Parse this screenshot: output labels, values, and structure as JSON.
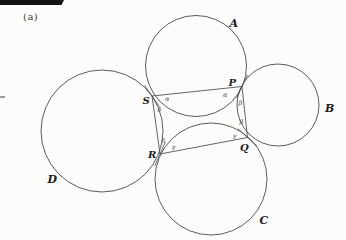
{
  "page": {
    "label_a": "(a)"
  },
  "figure": {
    "circles": [
      {
        "id": "A",
        "label": "A",
        "cx": 196,
        "cy": 66,
        "r": 50.5,
        "lx": 229.5,
        "ly": 27
      },
      {
        "id": "B",
        "label": "B",
        "cx": 278,
        "cy": 105,
        "r": 41,
        "lx": 325,
        "ly": 112
      },
      {
        "id": "C",
        "label": "C",
        "cx": 211,
        "cy": 179,
        "r": 56,
        "lx": 259.5,
        "ly": 223.5
      },
      {
        "id": "D",
        "label": "D",
        "cx": 102,
        "cy": 131,
        "r": 61,
        "lx": 47.5,
        "ly": 183
      }
    ],
    "points": [
      {
        "id": "S",
        "label": "S",
        "x": 152,
        "y": 96,
        "lx": 142.5,
        "ly": 103.5,
        "between": [
          "A",
          "D"
        ]
      },
      {
        "id": "P",
        "label": "P",
        "x": 242,
        "y": 86.5,
        "lx": 228.5,
        "ly": 86,
        "between": [
          "A",
          "B"
        ]
      },
      {
        "id": "Q",
        "label": "Q",
        "x": 247.5,
        "y": 137.5,
        "lx": 240,
        "ly": 151,
        "between": [
          "B",
          "C"
        ]
      },
      {
        "id": "R",
        "label": "R",
        "x": 160,
        "y": 154,
        "lx": 148,
        "ly": 157.5,
        "between": [
          "C",
          "D"
        ]
      }
    ],
    "quad": [
      "S",
      "P",
      "Q",
      "R"
    ],
    "tangent_half_length": 13,
    "angle_labels": [
      {
        "text": "α",
        "x": 165,
        "y": 101
      },
      {
        "text": "α",
        "x": 223,
        "y": 97
      },
      {
        "text": "β",
        "x": 238.5,
        "y": 105
      },
      {
        "text": "β",
        "x": 239.5,
        "y": 124
      },
      {
        "text": "γ",
        "x": 232.5,
        "y": 138
      },
      {
        "text": "γ",
        "x": 171.5,
        "y": 149
      },
      {
        "text": "δ",
        "x": 161.5,
        "y": 143
      },
      {
        "text": "δ",
        "x": 157.5,
        "y": 112
      }
    ],
    "colors": {
      "stroke": "#4a4a4a",
      "label": "#1c1c1c",
      "background": "#fcfcfb",
      "scan_bar": "#141414"
    }
  }
}
